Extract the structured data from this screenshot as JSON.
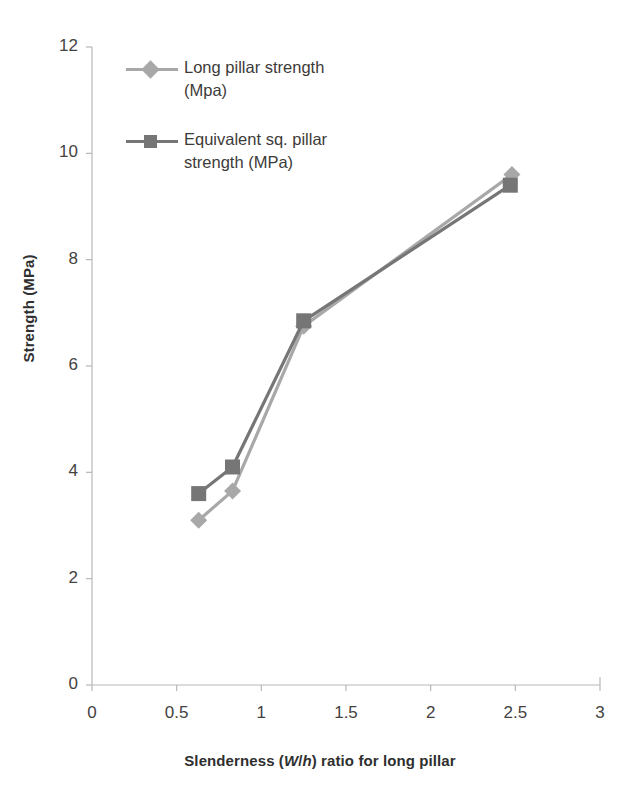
{
  "chart_data": {
    "type": "line",
    "title": "",
    "xlabel": "Slenderness (W/h) ratio for long pillar",
    "xlabel_parts": {
      "prefix": "Slenderness (",
      "italic_w": "W",
      "slash": "/",
      "italic_h": "h",
      "suffix": ") ratio for long pillar"
    },
    "ylabel": "Strength (MPa)",
    "xlim": [
      0,
      3
    ],
    "ylim": [
      0,
      12
    ],
    "xticks": [
      "0",
      "0.5",
      "1",
      "1.5",
      "2",
      "2.5",
      "3"
    ],
    "xtick_values": [
      0,
      0.5,
      1,
      1.5,
      2,
      2.5,
      3
    ],
    "yticks": [
      "0",
      "2",
      "4",
      "6",
      "8",
      "10",
      "12"
    ],
    "ytick_values": [
      0,
      2,
      4,
      6,
      8,
      10,
      12
    ],
    "grid": false,
    "legend_position": "inside-top-left",
    "series": [
      {
        "name": "Long pillar strength (Mpa)",
        "marker": "diamond",
        "color": "#a8a8a8",
        "x": [
          0.63,
          0.83,
          1.25,
          2.48
        ],
        "values": [
          3.1,
          3.65,
          6.75,
          9.6
        ]
      },
      {
        "name": "Equivalent sq. pillar strength (MPa)",
        "marker": "square",
        "color": "#767676",
        "x": [
          0.63,
          0.83,
          1.25,
          2.47
        ],
        "values": [
          3.6,
          4.1,
          6.85,
          9.4
        ]
      }
    ]
  },
  "legend": {
    "entries": [
      {
        "label": "Long pillar strength (Mpa)",
        "marker": "diamond",
        "color": "#a8a8a8"
      },
      {
        "label": "Equivalent sq. pillar strength (MPa)",
        "marker": "square",
        "color": "#767676"
      }
    ]
  },
  "colors": {
    "axis": "#b7b7b7",
    "tick_text": "#44423f",
    "title_text": "#2f2f2f",
    "series_1": "#a8a8a8",
    "series_2": "#767676",
    "background": "#ffffff"
  }
}
